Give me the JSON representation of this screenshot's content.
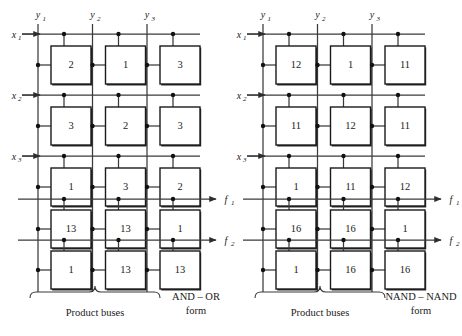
{
  "figure": {
    "panels": [
      {
        "id": "left-panel",
        "form_label_line1": "AND – OR",
        "form_label_line2": "form",
        "bus_caption": "Product buses",
        "column_labels": [
          "y",
          "y",
          "y"
        ],
        "column_subscripts": [
          "1",
          "2",
          "3"
        ],
        "row_input_labels": [
          "x",
          "x",
          "x"
        ],
        "row_input_subscripts": [
          "1",
          "2",
          "3"
        ],
        "row_output_labels": [
          "f",
          "f"
        ],
        "row_output_subscripts": [
          "1",
          "2"
        ],
        "rows": [
          {
            "label": "x1",
            "type": "input",
            "cells": [
              "2",
              "1",
              "3"
            ]
          },
          {
            "label": "x2",
            "type": "input",
            "cells": [
              "3",
              "2",
              "3"
            ]
          },
          {
            "label": "x3",
            "type": "input",
            "cells": [
              "1",
              "3",
              "2"
            ]
          },
          {
            "label": "f1",
            "type": "output",
            "cells": [
              "13",
              "13",
              "1"
            ]
          },
          {
            "label": "f2",
            "type": "output",
            "cells": [
              "1",
              "13",
              "13"
            ]
          }
        ]
      },
      {
        "id": "right-panel",
        "form_label_line1": "NAND – NAND",
        "form_label_line2": "form",
        "bus_caption": "Product buses",
        "column_labels": [
          "y",
          "y",
          "y"
        ],
        "column_subscripts": [
          "1",
          "2",
          "3"
        ],
        "row_input_labels": [
          "x",
          "x",
          "x"
        ],
        "row_input_subscripts": [
          "1",
          "2",
          "3"
        ],
        "row_output_labels": [
          "f",
          "f"
        ],
        "row_output_subscripts": [
          "1",
          "2"
        ],
        "rows": [
          {
            "label": "x1",
            "type": "input",
            "cells": [
              "12",
              "1",
              "11"
            ]
          },
          {
            "label": "x2",
            "type": "input",
            "cells": [
              "11",
              "12",
              "11"
            ]
          },
          {
            "label": "x3",
            "type": "input",
            "cells": [
              "1",
              "11",
              "12"
            ]
          },
          {
            "label": "f1",
            "type": "output",
            "cells": [
              "16",
              "16",
              "1"
            ]
          },
          {
            "label": "f2",
            "type": "output",
            "cells": [
              "1",
              "16",
              "16"
            ]
          }
        ]
      }
    ],
    "colors": {
      "background": "#ffffff",
      "wire": "#3a3a3a",
      "box_outline": "#1a1a1a",
      "node_dot": "#111111",
      "text": "#1a1a1a"
    }
  }
}
